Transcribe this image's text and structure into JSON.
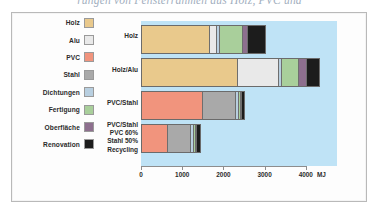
{
  "caption_bleed": "rungen von Fensterrahmen aus Holz, PVC und",
  "legend": {
    "items": [
      {
        "label": "Holz",
        "color": "#e9c98c",
        "swatch_name": "legend-swatch-holz"
      },
      {
        "label": "Alu",
        "color": "#e9e9e9",
        "swatch_name": "legend-swatch-alu"
      },
      {
        "label": "PVC",
        "color": "#f1947d",
        "swatch_name": "legend-swatch-pvc"
      },
      {
        "label": "Stahl",
        "color": "#a9a9a9",
        "swatch_name": "legend-swatch-stahl"
      },
      {
        "label": "Dichtungen",
        "color": "#b8cfe0",
        "swatch_name": "legend-swatch-dichtungen"
      },
      {
        "label": "Fertigung",
        "color": "#a9cf9b",
        "swatch_name": "legend-swatch-fertigung"
      },
      {
        "label": "Oberfläche",
        "color": "#8d6f8e",
        "swatch_name": "legend-swatch-oberflaeche"
      },
      {
        "label": "Renovation",
        "color": "#1c1c1c",
        "swatch_name": "legend-swatch-renovation"
      }
    ]
  },
  "row_labels": [
    {
      "lines": [
        "Holz"
      ]
    },
    {
      "lines": [
        "Holz/Alu"
      ]
    },
    {
      "lines": [
        "PVC/Stahl"
      ]
    },
    {
      "lines": [
        "PVC/Stahl",
        "PVC 60%",
        "Stahl 50%",
        "Recycling"
      ]
    }
  ],
  "axis": {
    "ticks": [
      "0",
      "1000",
      "2000",
      "3000",
      "4000"
    ],
    "unit": "MJ"
  },
  "chart_data": {
    "type": "bar",
    "orientation": "horizontal",
    "stacked": true,
    "title": "",
    "xlabel": "MJ",
    "ylabel": "",
    "xlim": [
      0,
      4400
    ],
    "xticks": [
      0,
      1000,
      2000,
      3000,
      4000
    ],
    "grid": false,
    "legend_position": "left",
    "plot_background": "#bfe3f6",
    "categories": [
      "Holz",
      "Holz/Alu",
      "PVC/Stahl",
      "PVC/Stahl PVC 60% Stahl 50% Recycling"
    ],
    "series": [
      {
        "name": "Holz",
        "color": "#e9c98c",
        "values": [
          1660,
          2320,
          0,
          0
        ]
      },
      {
        "name": "Alu",
        "color": "#e9e9e9",
        "values": [
          170,
          990,
          0,
          0
        ]
      },
      {
        "name": "PVC",
        "color": "#f1947d",
        "values": [
          0,
          0,
          1470,
          630
        ]
      },
      {
        "name": "Stahl",
        "color": "#a9a9a9",
        "values": [
          0,
          0,
          810,
          560
        ]
      },
      {
        "name": "Dichtungen",
        "color": "#b8cfe0",
        "values": [
          60,
          70,
          60,
          60
        ]
      },
      {
        "name": "Fertigung",
        "color": "#a9cf9b",
        "values": [
          560,
          420,
          40,
          50
        ]
      },
      {
        "name": "Oberfläche",
        "color": "#8d6f8e",
        "values": [
          130,
          190,
          20,
          20
        ]
      },
      {
        "name": "Renovation",
        "color": "#1c1c1c",
        "values": [
          400,
          290,
          50,
          70
        ]
      }
    ],
    "totals": [
      2980,
      4280,
      2450,
      1390
    ]
  },
  "geometry": {
    "px_per_unit": 0.0412,
    "bar_rows": [
      {
        "top": 4,
        "segments": [
          {
            "series": "Holz",
            "color": "#e9c98c",
            "px": 68
          },
          {
            "series": "Alu",
            "color": "#e9e9e9",
            "px": 7
          },
          {
            "series": "Dichtungen",
            "color": "#b8cfe0",
            "px": 3
          },
          {
            "series": "Fertigung",
            "color": "#a9cf9b",
            "px": 23
          },
          {
            "series": "Oberfläche",
            "color": "#8d6f8e",
            "px": 5
          },
          {
            "series": "Renovation",
            "color": "#1c1c1c",
            "px": 17
          }
        ]
      },
      {
        "top": 37,
        "segments": [
          {
            "series": "Holz",
            "color": "#e9c98c",
            "px": 96
          },
          {
            "series": "Alu",
            "color": "#e9e9e9",
            "px": 41
          },
          {
            "series": "Dichtungen",
            "color": "#b8cfe0",
            "px": 3
          },
          {
            "series": "Fertigung",
            "color": "#a9cf9b",
            "px": 17
          },
          {
            "series": "Oberfläche",
            "color": "#8d6f8e",
            "px": 8
          },
          {
            "series": "Renovation",
            "color": "#1c1c1c",
            "px": 12
          }
        ]
      },
      {
        "top": 70,
        "segments": [
          {
            "series": "PVC",
            "color": "#f1947d",
            "px": 61
          },
          {
            "series": "Stahl",
            "color": "#a9a9a9",
            "px": 33
          },
          {
            "series": "Dichtungen",
            "color": "#b8cfe0",
            "px": 3
          },
          {
            "series": "Fertigung",
            "color": "#a9cf9b",
            "px": 2
          },
          {
            "series": "Oberfläche",
            "color": "#8d6f8e",
            "px": 1
          },
          {
            "series": "Renovation",
            "color": "#1c1c1c",
            "px": 2
          }
        ]
      },
      {
        "top": 103,
        "segments": [
          {
            "series": "PVC",
            "color": "#f1947d",
            "px": 26
          },
          {
            "series": "Stahl",
            "color": "#a9a9a9",
            "px": 23
          },
          {
            "series": "Dichtungen",
            "color": "#b8cfe0",
            "px": 3
          },
          {
            "series": "Fertigung",
            "color": "#a9cf9b",
            "px": 2
          },
          {
            "series": "Oberfläche",
            "color": "#8d6f8e",
            "px": 1
          },
          {
            "series": "Renovation",
            "color": "#1c1c1c",
            "px": 3
          }
        ]
      }
    ],
    "row_label_tops": [
      11,
      45,
      78,
      100
    ],
    "tick_px": [
      0,
      41.2,
      82.4,
      123.6,
      164.8
    ]
  }
}
